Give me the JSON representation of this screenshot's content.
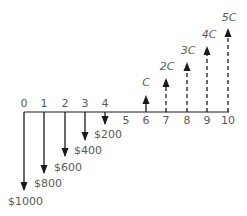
{
  "diagram": {
    "type": "cash-flow-diagram",
    "colors": {
      "line": "#1a1a1a",
      "text": "#5a5a5a",
      "background": "#ffffff"
    },
    "axis": {
      "periods": [
        "0",
        "1",
        "2",
        "3",
        "4",
        "5",
        "6",
        "7",
        "8",
        "9",
        "10"
      ]
    },
    "outflows": [
      {
        "period": "0",
        "label": "$1000"
      },
      {
        "period": "1",
        "label": "$800"
      },
      {
        "period": "2",
        "label": "$600"
      },
      {
        "period": "3",
        "label": "$400"
      },
      {
        "period": "4",
        "label": "$200"
      }
    ],
    "inflows": [
      {
        "period": "6",
        "label": "C",
        "style": "solid"
      },
      {
        "period": "7",
        "label": "2C",
        "style": "dashed"
      },
      {
        "period": "8",
        "label": "3C",
        "style": "dashed"
      },
      {
        "period": "9",
        "label": "4C",
        "style": "dashed"
      },
      {
        "period": "10",
        "label": "5C",
        "style": "dashed"
      }
    ]
  }
}
